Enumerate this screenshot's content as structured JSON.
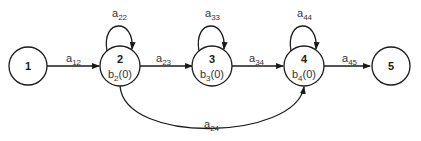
{
  "diagram": {
    "type": "state-transition-graph",
    "nodes": [
      {
        "id": "1",
        "label": "1",
        "b": null
      },
      {
        "id": "2",
        "label": "2",
        "b": {
          "base": "b",
          "sub": "2",
          "arg": "(0)"
        }
      },
      {
        "id": "3",
        "label": "3",
        "b": {
          "base": "b",
          "sub": "3",
          "arg": "(0)"
        }
      },
      {
        "id": "4",
        "label": "4",
        "b": {
          "base": "b",
          "sub": "4",
          "arg": "(0)"
        }
      },
      {
        "id": "5",
        "label": "5",
        "b": null
      }
    ],
    "edges": [
      {
        "from": "1",
        "to": "2",
        "base": "a",
        "sub": "12"
      },
      {
        "from": "2",
        "to": "2",
        "base": "a",
        "sub": "22"
      },
      {
        "from": "2",
        "to": "3",
        "base": "a",
        "sub": "23"
      },
      {
        "from": "3",
        "to": "3",
        "base": "a",
        "sub": "33"
      },
      {
        "from": "3",
        "to": "4",
        "base": "a",
        "sub": "34"
      },
      {
        "from": "4",
        "to": "4",
        "base": "a",
        "sub": "44"
      },
      {
        "from": "4",
        "to": "5",
        "base": "a",
        "sub": "45"
      },
      {
        "from": "2",
        "to": "4",
        "base": "a",
        "sub": "24"
      }
    ]
  },
  "colors": {
    "stroke": "#1a1a1a",
    "text": "#333333",
    "background": "#ffffff"
  }
}
